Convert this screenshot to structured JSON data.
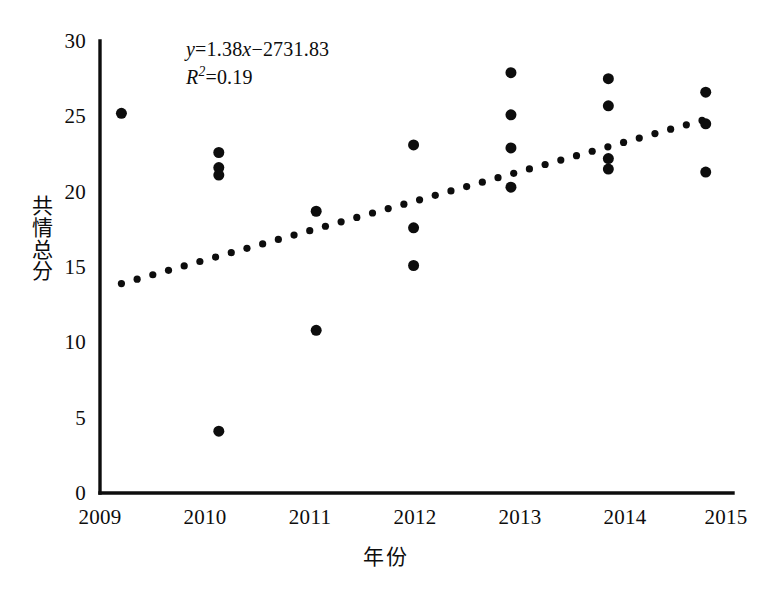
{
  "chart_data": {
    "type": "scatter",
    "title": "",
    "xlabel": "年份",
    "ylabel": "共情总分",
    "xlim": [
      2008.78,
      2015.28
    ],
    "ylim": [
      0,
      30
    ],
    "yticks": [
      0,
      5,
      10,
      15,
      20,
      25,
      30
    ],
    "xticks": [
      2009,
      2010,
      2011,
      2012,
      2013,
      2014,
      2015
    ],
    "xtick_labels": [
      "2009",
      "2010",
      "2011",
      "2012",
      "2013",
      "2014",
      "2015"
    ],
    "ytick_labels": [
      "0",
      "5",
      "10",
      "15",
      "20",
      "25",
      "30"
    ],
    "grid": false,
    "legend": null,
    "marker": {
      "shape": "circle",
      "color": "#0d0d0d",
      "size": 11
    },
    "points": [
      {
        "x": 2009,
        "y": 25.2
      },
      {
        "x": 2010,
        "y": 22.6
      },
      {
        "x": 2010,
        "y": 21.6
      },
      {
        "x": 2010,
        "y": 21.1
      },
      {
        "x": 2010,
        "y": 4.1
      },
      {
        "x": 2011,
        "y": 18.7
      },
      {
        "x": 2011,
        "y": 10.8
      },
      {
        "x": 2012,
        "y": 23.1
      },
      {
        "x": 2012,
        "y": 17.6
      },
      {
        "x": 2012,
        "y": 15.1
      },
      {
        "x": 2013,
        "y": 27.9
      },
      {
        "x": 2013,
        "y": 25.1
      },
      {
        "x": 2013,
        "y": 22.9
      },
      {
        "x": 2013,
        "y": 20.3
      },
      {
        "x": 2014,
        "y": 27.5
      },
      {
        "x": 2014,
        "y": 25.7
      },
      {
        "x": 2014,
        "y": 22.2
      },
      {
        "x": 2014,
        "y": 21.5
      },
      {
        "x": 2015,
        "y": 26.6
      },
      {
        "x": 2015,
        "y": 24.5
      },
      {
        "x": 2015,
        "y": 21.3
      }
    ],
    "trendline": {
      "style": "dotted",
      "color": "#0d0d0d",
      "slope": 1.38,
      "intercept": -2731.83,
      "x_start": 2009.0,
      "x_end": 2015.0,
      "y_start": 13.9,
      "y_end": 24.8
    },
    "annotations": {
      "equation_y": "y",
      "equation_body": "=1.38x−2731.83",
      "equation_slope_var": "x",
      "r_symbol": "R",
      "r_exponent": "2",
      "r_value": "=0.19"
    }
  }
}
